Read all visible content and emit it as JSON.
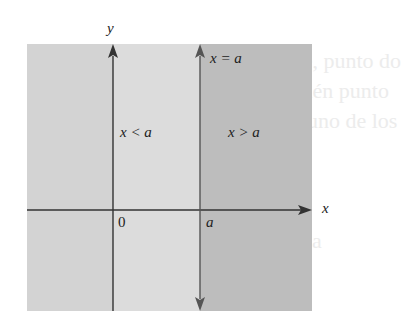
{
  "diagram": {
    "type": "half-plane regions",
    "axes": {
      "x_label": "x",
      "y_label": "y",
      "origin_label": "0"
    },
    "line": {
      "label": "x = a",
      "tick_label": "a"
    },
    "regions": [
      {
        "id": "left",
        "label": "x < a",
        "color": "#d3d3d3"
      },
      {
        "id": "middle",
        "label": "",
        "color": "#dcdcdc"
      },
      {
        "id": "right",
        "label": "x > a",
        "color": "#bdbdbd"
      }
    ],
    "region_labels": {
      "left": "x < a",
      "right": "x > a"
    },
    "colors": {
      "axis": "#333333",
      "line": "#555555",
      "background": "#ffffff"
    }
  },
  "background_text": {
    "lines": [
      "ligadamente, punto do",
      "nto es también punto",
      "ntes a cada uno de los",
      "ncia"
    ]
  }
}
